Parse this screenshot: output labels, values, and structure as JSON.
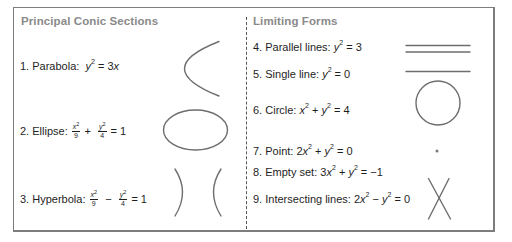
{
  "sections": {
    "principal": {
      "title": "Principal Conic Sections",
      "items": [
        {
          "number": "1.",
          "name": "Parabola:",
          "equation": "y² = 3x",
          "shape": "parabola"
        },
        {
          "number": "2.",
          "name": "Ellipse:",
          "equation": "x²/9 + y²/4 = 1",
          "shape": "ellipse",
          "terms": [
            {
              "num": "x",
              "den": "9"
            },
            {
              "op": "+"
            },
            {
              "num": "y",
              "den": "4"
            }
          ],
          "rhs": "= 1"
        },
        {
          "number": "3.",
          "name": "Hyperbola:",
          "equation": "x²/9 − y²/4 = 1",
          "shape": "hyperbola",
          "terms": [
            {
              "num": "x",
              "den": "9"
            },
            {
              "op": "−"
            },
            {
              "num": "y",
              "den": "4"
            }
          ],
          "rhs": "= 1"
        }
      ]
    },
    "limiting": {
      "title": "Limiting Forms",
      "items": [
        {
          "number": "4.",
          "name": "Parallel lines:",
          "equation": "y² = 3",
          "shape": "parallel-lines"
        },
        {
          "number": "5.",
          "name": "Single line:",
          "equation": "y² = 0",
          "shape": "single-line"
        },
        {
          "number": "6.",
          "name": "Circle:",
          "equation": "x² + y² = 4",
          "shape": "circle"
        },
        {
          "number": "7.",
          "name": "Point:",
          "equation": "2x² + y² = 0",
          "shape": "point"
        },
        {
          "number": "8.",
          "name": "Empty set:",
          "equation": "3x² + y² = −1",
          "shape": "none"
        },
        {
          "number": "9.",
          "name": "Intersecting lines:",
          "equation": "2x² − y² = 0",
          "shape": "intersecting-lines"
        }
      ]
    }
  },
  "colors": {
    "frame": "#7d7d7d",
    "header_text": "#8a8a8a",
    "body_text": "#1e1e1e",
    "curve_stroke": "#6e6e6e",
    "divider": "#555555"
  },
  "glyphs": {
    "sq": "2",
    "x": "x",
    "y": "y",
    "eq": "=",
    "plus": "+",
    "minus": "−"
  }
}
